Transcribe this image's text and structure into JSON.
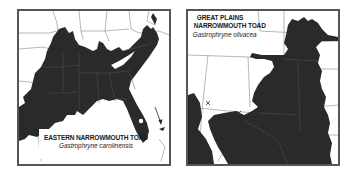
{
  "maps": [
    {
      "id": "left",
      "common_name": "EASTERN NARROWMOUTH TOAD",
      "scientific_name": "Gastrophryne carolinensis",
      "region": "Southeastern United States",
      "range_color": "#2a2a2a",
      "markers": [
        "arrow pointing to Florida Keys"
      ]
    },
    {
      "id": "right",
      "common_name_line1": "GREAT PLAINS",
      "common_name_line2": "NARROWMOUTH TOAD",
      "scientific_name": "Gastrophryne olivacea",
      "region": "South-central United States",
      "range_color": "#2a2a2a",
      "markers": [
        "x",
        "x"
      ]
    }
  ],
  "colors": {
    "frame": "#555555",
    "range_fill": "#2a2a2a",
    "state_lines": "#777777",
    "background": "#ffffff"
  }
}
